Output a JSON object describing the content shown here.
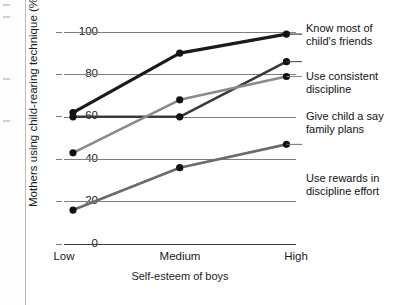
{
  "chart_data": {
    "type": "line",
    "title": "",
    "xlabel": "Self-esteem of boys",
    "ylabel": "Mothers using child-rearing technique (%)",
    "categories": [
      "Low",
      "Medium",
      "High"
    ],
    "ylim": [
      0,
      100
    ],
    "yticks": [
      "0",
      "20",
      "40",
      "60",
      "80",
      "100"
    ],
    "grid": true,
    "legend_position": "right",
    "series": [
      {
        "name": "Know most of child's friends",
        "values": [
          62,
          90,
          99
        ],
        "color": "#1a1a1a",
        "width": 3.2
      },
      {
        "name": "Use consistent discipline",
        "values": [
          60,
          60,
          86
        ],
        "color": "#3a3a3a",
        "width": 2.6
      },
      {
        "name": "Give child a say family plans",
        "values": [
          43,
          68,
          79
        ],
        "color": "#8a8a8a",
        "width": 2.6
      },
      {
        "name": "Use rewards in discipline effort",
        "values": [
          16,
          36,
          47
        ],
        "color": "#6b6b6b",
        "width": 2.6
      }
    ]
  },
  "legend": {
    "items": [
      {
        "line1": "Know most of",
        "line2": "child's friends"
      },
      {
        "line1": "Use consistent",
        "line2": "discipline"
      },
      {
        "line1": "Give child a say",
        "line2": "family plans"
      },
      {
        "line1": "Use rewards in",
        "line2": "discipline effort"
      }
    ]
  },
  "axes": {
    "y_tick_0": "0",
    "y_tick_1": "20",
    "y_tick_2": "40",
    "y_tick_3": "60",
    "y_tick_4": "80",
    "y_tick_5": "100",
    "x_tick_0": "Low",
    "x_tick_1": "Medium",
    "x_tick_2": "High",
    "x_axis_title": "Self-esteem of boys",
    "y_axis_title": "Mothers using child-rearing technique (%)"
  }
}
